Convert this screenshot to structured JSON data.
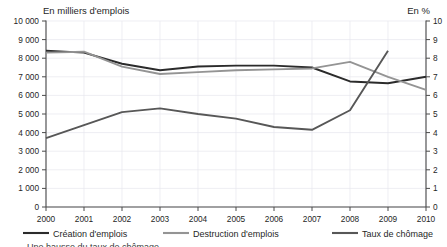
{
  "chart_data": {
    "type": "line",
    "title": "",
    "axis_title_left": "En milliers d'emplois",
    "axis_title_right": "En %",
    "xlabel": "",
    "x": [
      2000,
      2001,
      2002,
      2003,
      2004,
      2005,
      2006,
      2007,
      2008,
      2009,
      2010
    ],
    "xtick_labels": [
      "2000",
      "2001",
      "2002",
      "2003",
      "2004",
      "2005",
      "2006",
      "2007",
      "2008",
      "2009",
      "2010"
    ],
    "left_axis": {
      "min": 0,
      "max": 10000,
      "step": 1000,
      "tick_labels": [
        "0",
        "1 000",
        "2 000",
        "3 000",
        "4 000",
        "5 000",
        "6 000",
        "7 000",
        "8 000",
        "9 000",
        "10 000"
      ]
    },
    "right_axis": {
      "min": 0,
      "max": 10,
      "step": 1,
      "tick_labels": [
        "0",
        "1",
        "2",
        "3",
        "4",
        "5",
        "6",
        "7",
        "8",
        "9",
        "10"
      ]
    },
    "grid": true,
    "legend_position": "bottom",
    "series": [
      {
        "name": "Création d'emplois",
        "axis": "left",
        "color": "#2b2b2b",
        "values": [
          8400,
          8300,
          7700,
          7350,
          7550,
          7600,
          7600,
          7500,
          6750,
          6650,
          7000
        ]
      },
      {
        "name": "Destruction d'emplois",
        "axis": "left",
        "color": "#949494",
        "values": [
          8300,
          8350,
          7550,
          7150,
          7250,
          7350,
          7400,
          7450,
          7800,
          7000,
          6300
        ]
      },
      {
        "name": "Taux de chômage",
        "axis": "right",
        "color": "#575757",
        "values": [
          3.7,
          4.4,
          5.1,
          5.3,
          5.0,
          4.75,
          4.3,
          4.15,
          5.2,
          8.4,
          null
        ]
      }
    ]
  },
  "footer": {
    "clipped_note": "Une hausse du taux de chômage"
  }
}
